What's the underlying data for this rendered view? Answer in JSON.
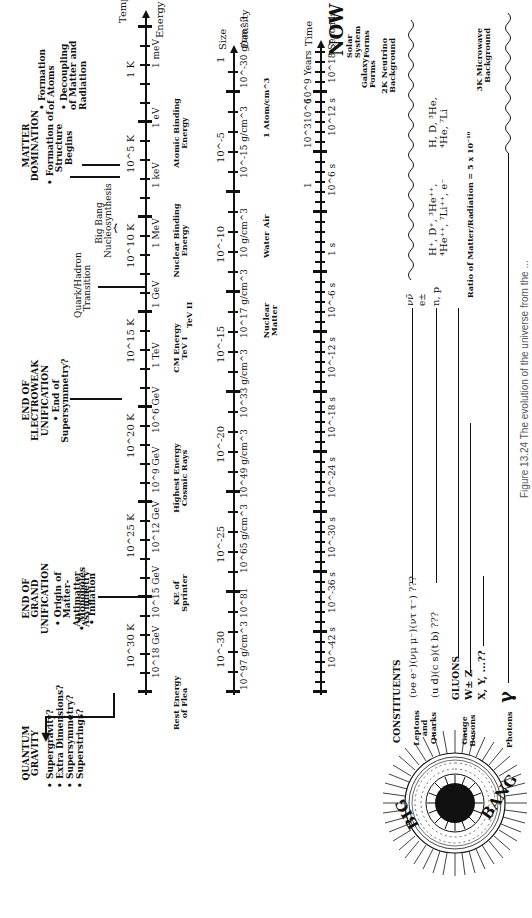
{
  "caption": "Figure 13.24  The evolution of the universe from the ...",
  "big_bang": {
    "word1": "BIG",
    "word2": "BANG"
  },
  "now_label": "NOW",
  "axes": {
    "temperature": {
      "title": "Temperature",
      "ticks": [
        "10^30 K",
        "10^25 K",
        "10^20 K",
        "10^15 K",
        "10^10 K",
        "10^5 K",
        "1 K"
      ]
    },
    "energy": {
      "title": "Energy",
      "ticks": [
        "10^18 GeV",
        "10^15 GeV",
        "10^12 GeV",
        "10^9 GeV",
        "10^6 GeV",
        "1 TeV",
        "1 GeV",
        "1 MeV",
        "1 keV",
        "1 eV",
        "1 meV"
      ]
    },
    "size": {
      "title": "Size",
      "ticks": [
        "10^-30",
        "10^-25",
        "10^-20",
        "10^-15",
        "10^-10",
        "10^-5",
        "1"
      ]
    },
    "density": {
      "title": "Density",
      "ticks": [
        "10^97 g/cm^3",
        "10^81",
        "10^65 g/cm^3",
        "10^49 g/cm^3",
        "10^33 g/cm^3",
        "10^17 g/cm^3",
        "10 g/cm^3",
        "10^-15 g/cm^3",
        "10^-30 g/cm^3"
      ]
    },
    "time": {
      "title": "Time",
      "seconds_ticks": [
        "10^-42 s",
        "10^-36 s",
        "10^-30 s",
        "10^-24 s",
        "10^-18 s",
        "10^-12 s",
        "10^-6 s",
        "1 s",
        "10^6 s",
        "10^12 s",
        "10^18 Seconds"
      ],
      "years_ticks": [
        "1",
        "10^3",
        "10^6",
        "10^9 Years"
      ]
    }
  },
  "events": {
    "quantum_gravity": {
      "title": "QUANTUM GRAVITY",
      "items": [
        "• Supergravity?",
        "• Extra Dimensions?",
        "• Supersymmetry?",
        "• Superstrings?"
      ]
    },
    "grand_unification": {
      "title": "END OF GRAND UNIFICATION",
      "items": [
        "• Origin of Matter-Antimatter Asymmetry",
        "• Monopoles",
        "• Inflation"
      ]
    },
    "electroweak": {
      "title": "END OF ELECTROWEAK UNIFICATION",
      "items": [
        "• End of Supersymmetry?"
      ]
    },
    "quark_hadron": {
      "title": "Quark/Hadron Transition"
    },
    "nucleosynthesis": {
      "title": "Big Bang Nucleosynthesis"
    },
    "matter_domination": {
      "title": "MATTER DOMINATION",
      "items": [
        "• Formation of Structure Begins"
      ]
    },
    "atoms": {
      "items": [
        "• Formation of Atoms",
        "• Decoupling of Matter and Radiation"
      ]
    }
  },
  "energy_markers": [
    "Rest Energy of Flea",
    "KE of Sprinter",
    "Highest Energy Cosmic Rays",
    "CM Energy TeV I",
    "TeV II",
    "Nuclear Binding Energy",
    "Atomic Binding Energy"
  ],
  "density_markers": [
    "Nuclear Matter",
    "Water",
    "Air",
    "1 Atom/cm^3"
  ],
  "time_markers": [
    "Galaxy Forms",
    "Solar System Forms"
  ],
  "constituents": {
    "title": "CONSTITUENTS",
    "leptons_quarks_label": "Leptons and Quarks",
    "leptons": "(νe e⁻)(νμ μ⁻)(ντ τ⁻) ???",
    "quarks": "(u d)(c s)(t b) ???",
    "gauge_bosons_label": "Gauge Bosons",
    "gluons": "GLUONS",
    "wz": "W± Z",
    "xy": "X, Y, ...??",
    "photons_label": "Photons",
    "photon_symbol": "γ",
    "neutrino_label": "νν̄",
    "positron_label": "e±",
    "np_label": "n, p",
    "plasma": "H⁺, D⁺, ³He⁺⁺, ⁴He⁺⁺, ⁷Li⁺⁺, e⁻",
    "atoms": "H, D, ³He, ⁴He, ⁷Li",
    "ratio": "Ratio of Matter/Radiation = 5 x 10⁻¹⁰",
    "neutrino_bg": "2K Neutrino Background",
    "microwave_bg": "3K Microwave Background"
  }
}
